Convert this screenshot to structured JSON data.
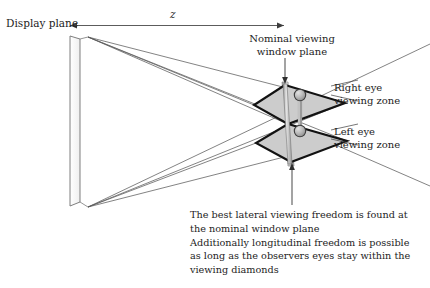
{
  "figure": {
    "type": "technical-optical-diagram"
  },
  "labels": {
    "display_plane": "Display plane",
    "z_axis": "z",
    "nominal_window_plane": "Nominal viewing\nwindow plane",
    "right_eye_zone": "Right eye\nviewing zone",
    "left_eye_zone": "Left eye\nviewing zone",
    "note": "The best lateral viewing freedom is found at the nominal window plane\nAdditionally longitudinal freedom is possible as long as the observers eyes stay within the viewing diamonds"
  },
  "note_lines": [
    "The best lateral viewing freedom is found at",
    "the nominal window plane",
    "Additionally longitudinal freedom is possible",
    "as long as the observers eyes stay within the",
    "viewing diamonds"
  ],
  "nominal_window_lines": [
    "Nominal viewing",
    "window plane"
  ],
  "right_eye_lines": [
    "Right eye",
    "viewing zone"
  ],
  "left_eye_lines": [
    "Left eye",
    "viewing zone"
  ],
  "colors": {
    "background": "#ffffff",
    "line": "#4a4a4a",
    "ray": "#555555",
    "diamond_fill": "#cccccc",
    "diamond_stroke": "#111111",
    "eye_fill": "#b4b4b4",
    "eye_stroke": "#3a3a3a",
    "plane_fill": "#fbfbfb",
    "plane_stroke": "#6b6b6b",
    "text": "#1c1c1c"
  },
  "geometry": {
    "display_plane": {
      "front_top": [
        70,
        36
      ],
      "front_bottom": [
        70,
        206
      ],
      "back_top": [
        80,
        39
      ],
      "back_bottom": [
        80,
        202
      ],
      "apex_top": [
        88,
        37
      ],
      "apex_bottom": [
        88,
        207
      ]
    },
    "z_arrow": {
      "x1": 70,
      "x2": 284,
      "y": 25,
      "double_headed": true
    },
    "upper_diamond": {
      "top": [
        285,
        85
      ],
      "left": [
        254,
        105
      ],
      "bottom": [
        288,
        124
      ],
      "right": [
        345,
        103
      ]
    },
    "lower_diamond": {
      "top": [
        288,
        124
      ],
      "left": [
        256,
        143
      ],
      "bottom": [
        291,
        162
      ],
      "right": [
        347,
        141
      ]
    },
    "eyes": [
      {
        "name": "right-eye-sphere",
        "cx": 300,
        "cy": 95,
        "r": 5.6
      },
      {
        "name": "left-eye-sphere",
        "cx": 300,
        "cy": 131,
        "r": 5.6
      }
    ],
    "window_plane_bar": {
      "x_top": 284,
      "y_top": 84,
      "x_bottom": 291,
      "y_bottom": 164,
      "width": 4
    },
    "nominal_arrow": {
      "x": 285,
      "y1": 58,
      "y2": 82
    },
    "bottom_arrow": {
      "x": 292,
      "y1": 205,
      "y2": 166
    },
    "rays_from_top": [
      [
        345,
        103
      ],
      [
        347,
        141
      ],
      [
        430,
        186
      ],
      [
        254,
        105
      ]
    ],
    "rays_from_bottom": [
      [
        347,
        141
      ],
      [
        345,
        103
      ],
      [
        430,
        44
      ],
      [
        256,
        143
      ]
    ]
  }
}
